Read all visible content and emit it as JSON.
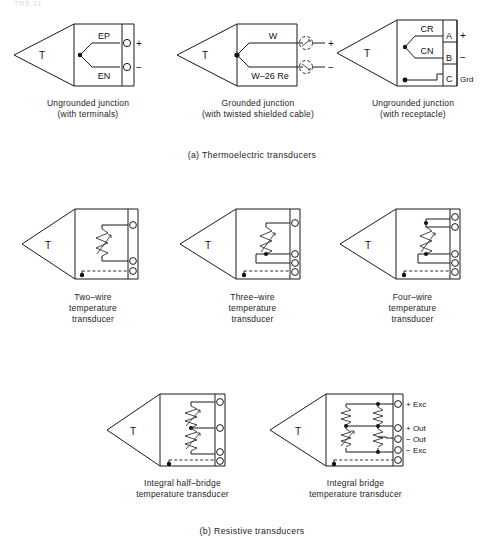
{
  "figure": {
    "top_artifact": "TR5.11",
    "sections": [
      {
        "id": "a",
        "caption": "(a) Thermoelectric transducers"
      },
      {
        "id": "b",
        "caption": "(b) Resistive transducers"
      }
    ]
  },
  "thermoelectric": [
    {
      "name": "ungrounded-junction-terminals",
      "body_label": "T",
      "lead_labels": [
        "EP",
        "EN"
      ],
      "terminal_signs": [
        "+",
        "−"
      ],
      "caption": "Ungrounded junction\n(with terminals)"
    },
    {
      "name": "grounded-junction-twisted-cable",
      "body_label": "T",
      "lead_labels": [
        "W",
        "W–26 Re"
      ],
      "terminal_signs": [
        "+",
        "−"
      ],
      "caption": "Grounded junction\n(with twisted shielded cable)"
    },
    {
      "name": "ungrounded-junction-receptacle",
      "body_label": "T",
      "lead_labels": [
        "CR",
        "CN"
      ],
      "pin_labels": [
        "A",
        "B",
        "C"
      ],
      "pin_signs": [
        "+",
        "−",
        "Grd"
      ],
      "caption": "Ungrounded junction\n(with receptacle)"
    }
  ],
  "resistive": [
    {
      "name": "two-wire-temperature-transducer",
      "body_label": "T",
      "terminal_count": 3,
      "caption": "Two–wire\ntemperature\ntransducer"
    },
    {
      "name": "three-wire-temperature-transducer",
      "body_label": "T",
      "terminal_count": 4,
      "caption": "Three–wire\ntemperature\ntransducer"
    },
    {
      "name": "four-wire-temperature-transducer",
      "body_label": "T",
      "terminal_count": 5,
      "caption": "Four–wire\ntemperature\ntransducer"
    },
    {
      "name": "integral-half-bridge-temperature-transducer",
      "body_label": "T",
      "terminal_count": 4,
      "caption": "Integral half–bridge\ntemperature transducer"
    },
    {
      "name": "integral-bridge-temperature-transducer",
      "body_label": "T",
      "terminal_count": 5,
      "terminal_labels": [
        "+ Exc",
        "+ Out",
        "− Out",
        "− Exc"
      ],
      "caption": "Integral bridge\ntemperature transducer"
    }
  ]
}
